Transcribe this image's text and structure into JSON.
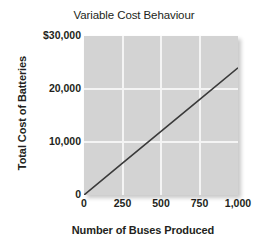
{
  "chart_data": {
    "type": "line",
    "title": "Variable Cost Behaviour",
    "xlabel": "Number of Buses Produced",
    "ylabel": "Total Cost of Batteries",
    "xlim": [
      0,
      1000
    ],
    "ylim": [
      0,
      30000
    ],
    "grid": true,
    "legend": null,
    "x_ticks": [
      {
        "value": 0,
        "label": "0"
      },
      {
        "value": 250,
        "label": "250"
      },
      {
        "value": 500,
        "label": "500"
      },
      {
        "value": 750,
        "label": "750"
      },
      {
        "value": 1000,
        "label": "1,000"
      }
    ],
    "y_ticks": [
      {
        "value": 0,
        "label": "0"
      },
      {
        "value": 10000,
        "label": "10,000"
      },
      {
        "value": 20000,
        "label": "20,000"
      },
      {
        "value": 30000,
        "label": "$30,000"
      }
    ],
    "series": [
      {
        "name": "Total variable cost",
        "x": [
          0,
          250,
          500,
          750,
          1000
        ],
        "values": [
          0,
          6000,
          12000,
          18000,
          24000
        ],
        "color": "#3a3a3a"
      }
    ]
  },
  "figure": {
    "panel_color": "#d3d3d3",
    "gridline_color": "#f4f4f4",
    "line_color": "#3a3a3a"
  }
}
